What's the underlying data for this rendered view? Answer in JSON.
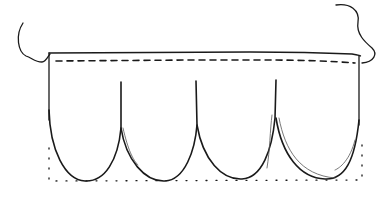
{
  "diagram": {
    "title": "",
    "scallop_count": 4,
    "colors": {
      "ink": "#1a1a1a",
      "background": "#ffffff"
    },
    "elements": [
      {
        "name": "top-edge",
        "style": "solid"
      },
      {
        "name": "seam-line",
        "style": "dashed"
      },
      {
        "name": "left-tail-curl",
        "style": "solid"
      },
      {
        "name": "right-tail-curl",
        "style": "solid"
      },
      {
        "name": "scallops",
        "count": 4,
        "style": "solid"
      },
      {
        "name": "pattern-outline",
        "style": "dotted"
      }
    ]
  }
}
